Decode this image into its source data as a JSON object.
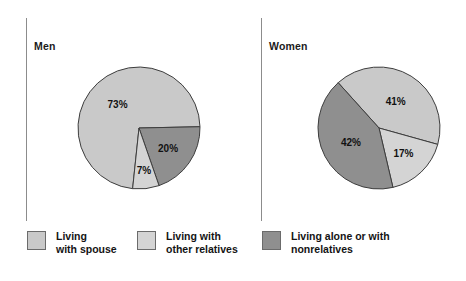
{
  "figure": {
    "panels": [
      {
        "name": "men",
        "title": "Men"
      },
      {
        "name": "women",
        "title": "Women"
      }
    ],
    "colors": {
      "living_with_spouse": "#c9c9c9",
      "living_with_other_relatives": "#d4d4d4",
      "living_alone_or_nonrelatives": "#8f8f8f",
      "slice_outline": "#3d3d3d",
      "divider": "#8c8c8c",
      "text": "#141414"
    }
  },
  "legend": {
    "items": [
      {
        "label": "Living\nwith spouse",
        "color": "#c9c9c9",
        "swatch_name": "legend-swatch-living-with-spouse"
      },
      {
        "label": "Living with\nother relatives",
        "color": "#d4d4d4",
        "swatch_name": "legend-swatch-living-with-other-relatives"
      },
      {
        "label": "Living alone or with\nnonrelatives",
        "color": "#8f8f8f",
        "swatch_name": "legend-swatch-living-alone-or-nonrelatives"
      }
    ]
  },
  "chart_data": {
    "type": "pie",
    "title": "",
    "legend_position": "bottom",
    "charts": [
      {
        "name": "men",
        "title": "Men",
        "categories": [
          "Living with spouse",
          "Living alone or with nonrelatives",
          "Living with other relatives"
        ],
        "values": [
          73,
          20,
          7
        ],
        "labels": [
          "73%",
          "20%",
          "7%"
        ],
        "colors": [
          "#c9c9c9",
          "#8f8f8f",
          "#d4d4d4"
        ]
      },
      {
        "name": "women",
        "title": "Women",
        "categories": [
          "Living with spouse",
          "Living with other relatives",
          "Living alone or with nonrelatives"
        ],
        "values": [
          41,
          17,
          42
        ],
        "labels": [
          "41%",
          "17%",
          "42%"
        ],
        "colors": [
          "#c9c9c9",
          "#d4d4d4",
          "#8f8f8f"
        ]
      }
    ],
    "units": "percent",
    "xlabel": "",
    "ylabel": ""
  }
}
